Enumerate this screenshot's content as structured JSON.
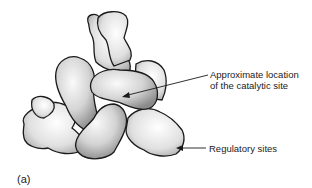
{
  "figure": {
    "panel_label": "(a)",
    "annotations": [
      {
        "id": "catalytic",
        "line1": "Approximate location",
        "line2": "of the catalytic site"
      },
      {
        "id": "regulatory",
        "line1": "Regulatory sites"
      }
    ]
  },
  "colors": {
    "background": "#ffffff",
    "protein_light": "#f2f2f2",
    "protein_mid": "#c8c8c8",
    "protein_dark": "#8c8c8c",
    "outline": "#1a1a1a",
    "text": "#222222"
  }
}
